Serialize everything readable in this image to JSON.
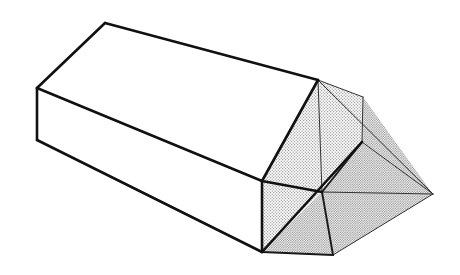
{
  "figure": {
    "title": "Isometric line drawing of an elongated prismatic solid with a gabled roof and a chamfered, hipped right end",
    "canvas": {
      "width": 460,
      "height": 275,
      "background": "#ffffff"
    },
    "style": {
      "outline_color": "#111111",
      "interior_line_color": "#333333",
      "white_fill": "#ffffff",
      "stipple_fill_light": "#d6d6d6",
      "stipple_fill_dark": "#bdbdbd",
      "heavy_stroke_width": 2.6,
      "medium_stroke_width": 1.9,
      "light_stroke_width": 1.0
    },
    "vertices": {
      "ridge_left": [
        105,
        23
      ],
      "ridge_right": [
        318,
        80
      ],
      "eave_left_top": [
        37,
        88
      ],
      "eave_left_bottom": [
        37,
        140
      ],
      "eave_front_top": [
        262,
        181
      ],
      "eave_front_bottom": [
        262,
        252
      ],
      "gable_right_top": [
        363,
        97
      ],
      "gable_right_mid": [
        362,
        142
      ],
      "far_right": [
        433,
        194
      ],
      "bottom_vertex": [
        333,
        255
      ],
      "center_bottom": [
        322,
        192
      ],
      "hip_inner": [
        345,
        168
      ]
    },
    "faces": [
      {
        "name": "roof-top-plane",
        "fill": "white",
        "label": "Large upper roof slope"
      },
      {
        "name": "wall-front-plane",
        "fill": "white",
        "label": "Long front wall face"
      },
      {
        "name": "gable-left-panel",
        "fill": "stipple",
        "label": "Left half of the shaded end gable"
      },
      {
        "name": "gable-right-panel",
        "fill": "stipple",
        "label": "Right half of the shaded end gable"
      },
      {
        "name": "hip-lower-panel",
        "fill": "gray",
        "label": "Lower chamfered hip panel"
      },
      {
        "name": "hip-right-panel",
        "fill": "gray",
        "label": "Right chamfered hip panel"
      },
      {
        "name": "hip-sliver-panel",
        "fill": "gray",
        "label": "Narrow sliver panel at right edge"
      }
    ]
  }
}
